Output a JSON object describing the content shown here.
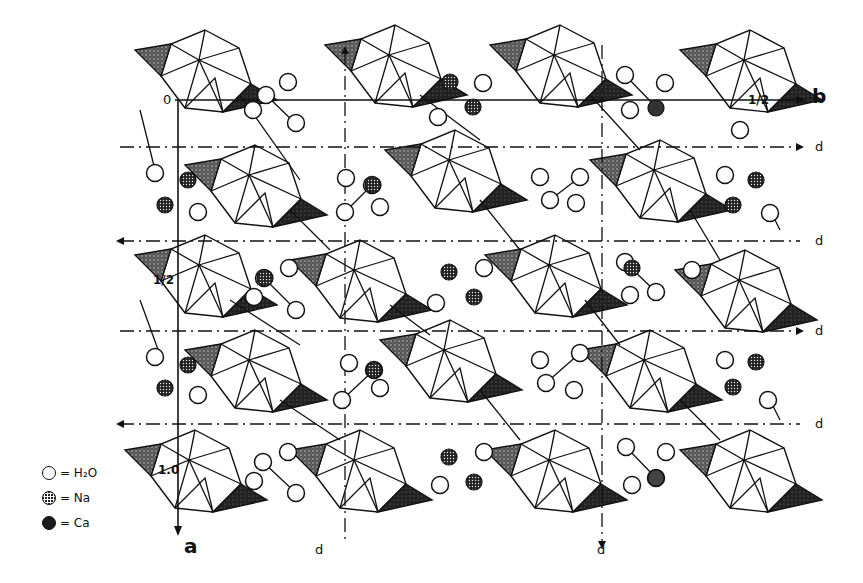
{
  "figure": {
    "type": "crystal-structure-projection",
    "axes": {
      "origin_label": "0",
      "b_label": "b",
      "a_label": "a",
      "half_b_label": "1/2",
      "half_a_label": "1/2",
      "unit_a_label": "1.0"
    },
    "glide_planes": {
      "horizontal": [
        {
          "label": "d",
          "y": 147
        },
        {
          "label": "d",
          "y": 241
        },
        {
          "label": "d",
          "y": 331
        },
        {
          "label": "d",
          "y": 424
        }
      ],
      "vertical": [
        {
          "label": "d",
          "x": 345
        },
        {
          "label": "d",
          "x": 602
        }
      ]
    },
    "legend": [
      {
        "symbol": "open-circle",
        "text": "= H₂O"
      },
      {
        "symbol": "dotted-circle",
        "text": "= Na"
      },
      {
        "symbol": "filled-circle",
        "text": "= Ca"
      }
    ]
  }
}
